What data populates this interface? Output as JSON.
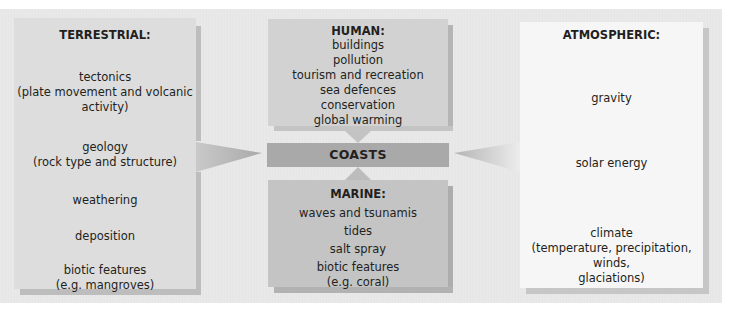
{
  "diagram": {
    "center": {
      "label": "COASTS"
    },
    "terrestrial": {
      "title": "TERRESTRIAL:",
      "items": [
        {
          "line1": "tectonics",
          "line2": "(plate movement and volcanic",
          "line3": "activity)"
        },
        {
          "line1": "geology",
          "line2": "(rock type and structure)"
        },
        {
          "line1": "weathering"
        },
        {
          "line1": "deposition"
        },
        {
          "line1": "biotic features",
          "line2": "(e.g. mangroves)"
        }
      ]
    },
    "human": {
      "title": "HUMAN:",
      "items": [
        "buildings",
        "pollution",
        "tourism and recreation",
        "sea defences",
        "conservation",
        "global warming"
      ]
    },
    "marine": {
      "title": "MARINE:",
      "items": [
        {
          "line1": "waves and tsunamis"
        },
        {
          "line1": "tides"
        },
        {
          "line1": "salt spray"
        },
        {
          "line1": "biotic features",
          "line2": "(e.g. coral)"
        }
      ]
    },
    "atmospheric": {
      "title": "ATMOSPHERIC:",
      "items": [
        {
          "line1": "gravity"
        },
        {
          "line1": "solar energy"
        },
        {
          "line1": "climate",
          "line2": "(temperature, precipitation, winds,",
          "line3": "glaciations)"
        }
      ]
    },
    "colors": {
      "terrestrial": "#dddddd",
      "human": "#d2d2d2",
      "coasts": "#a9a9a9",
      "marine": "#c4c4c4",
      "atmospheric": "#f6f6f6",
      "background": "#e8e8e8"
    }
  }
}
